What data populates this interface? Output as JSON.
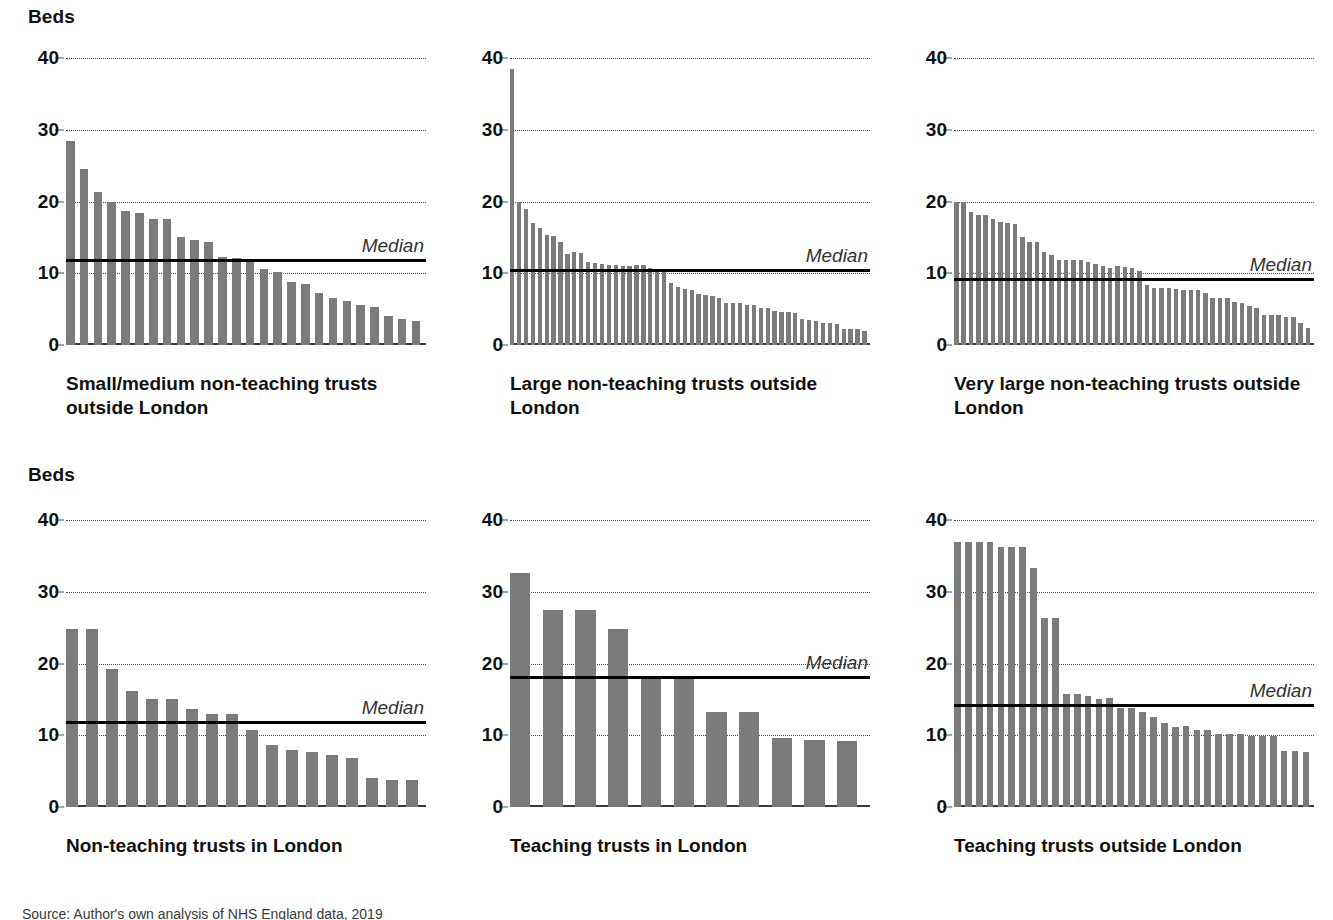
{
  "axis_title": "Beds",
  "median_label": "Median",
  "colors": {
    "bar": "#7b7b7b",
    "median_line": "#000000",
    "gridline": "#4d4d4d",
    "axis": "#3a3a3a",
    "text": "#111111"
  },
  "yticks": [
    "0",
    "10",
    "20",
    "30",
    "40"
  ],
  "footnote": "Source: Author's own analysis of NHS England data, 2019",
  "chart_data": [
    {
      "type": "bar",
      "title": "Small/medium non-teaching trusts outside London",
      "ylabel": "Beds",
      "xlabel": "",
      "ylim": [
        0,
        40
      ],
      "yticks": [
        0,
        10,
        20,
        30,
        40
      ],
      "grid": true,
      "median": 12.0,
      "median_annotation": "Median",
      "values": [
        28.4,
        24.5,
        21.3,
        20.0,
        18.7,
        18.4,
        17.6,
        17.5,
        15.1,
        14.6,
        14.3,
        12.3,
        12.1,
        12.0,
        10.6,
        10.2,
        8.8,
        8.5,
        7.3,
        6.6,
        6.1,
        5.6,
        5.3,
        4.0,
        3.6,
        3.3
      ]
    },
    {
      "type": "bar",
      "title": "Large non-teaching trusts outside London",
      "ylabel": "Beds",
      "xlabel": "",
      "ylim": [
        0,
        40
      ],
      "yticks": [
        0,
        10,
        20,
        30,
        40
      ],
      "grid": true,
      "median": 10.6,
      "median_annotation": "Median",
      "values": [
        38.5,
        20.0,
        19.0,
        17.0,
        16.3,
        15.3,
        15.2,
        14.4,
        12.7,
        12.9,
        12.8,
        11.6,
        11.4,
        11.3,
        11.2,
        11.2,
        11.0,
        11.0,
        11.1,
        11.2,
        10.7,
        10.4,
        10.2,
        8.7,
        8.1,
        7.8,
        7.6,
        7.1,
        7.0,
        6.9,
        6.6,
        5.9,
        5.9,
        5.9,
        5.6,
        5.6,
        5.2,
        5.1,
        4.8,
        4.6,
        4.6,
        4.5,
        3.6,
        3.5,
        3.3,
        3.0,
        3.0,
        2.9,
        2.3,
        2.2,
        2.2,
        1.9
      ]
    },
    {
      "type": "bar",
      "title": "Very large non-teaching trusts outside London",
      "ylabel": "Beds",
      "xlabel": "",
      "ylim": [
        0,
        40
      ],
      "yticks": [
        0,
        10,
        20,
        30,
        40
      ],
      "grid": true,
      "median": 9.3,
      "median_annotation": "Median",
      "values": [
        20.0,
        20.0,
        18.6,
        18.1,
        18.1,
        17.6,
        17.1,
        17.0,
        16.8,
        15.1,
        14.3,
        14.3,
        12.9,
        12.6,
        11.9,
        11.9,
        11.9,
        11.8,
        11.6,
        11.3,
        11.0,
        10.8,
        11.0,
        10.9,
        10.8,
        10.3,
        8.4,
        8.0,
        8.0,
        8.0,
        7.8,
        7.7,
        7.6,
        7.6,
        7.3,
        6.5,
        6.5,
        6.5,
        6.0,
        5.9,
        5.4,
        5.1,
        4.2,
        4.2,
        4.2,
        3.9,
        3.9,
        3.1,
        2.4
      ]
    },
    {
      "type": "bar",
      "title": "Non-teaching trusts in London",
      "ylabel": "Beds",
      "xlabel": "",
      "ylim": [
        0,
        40
      ],
      "yticks": [
        0,
        10,
        20,
        30,
        40
      ],
      "grid": true,
      "median": 12.0,
      "median_annotation": "Median",
      "values": [
        24.8,
        24.8,
        19.2,
        16.2,
        15.0,
        15.0,
        13.7,
        12.9,
        12.9,
        10.8,
        8.6,
        8.0,
        7.7,
        7.3,
        6.8,
        4.1,
        3.7,
        3.7
      ]
    },
    {
      "type": "bar",
      "title": "Teaching trusts in London",
      "ylabel": "Beds",
      "xlabel": "",
      "ylim": [
        0,
        40
      ],
      "yticks": [
        0,
        10,
        20,
        30,
        40
      ],
      "grid": true,
      "median": 18.2,
      "median_annotation": "Median",
      "values": [
        32.6,
        27.5,
        27.5,
        24.8,
        17.9,
        17.9,
        13.3,
        13.3,
        9.6,
        9.3,
        9.2
      ]
    },
    {
      "type": "bar",
      "title": "Teaching trusts outside London",
      "ylabel": "Beds",
      "xlabel": "",
      "ylim": [
        0,
        40
      ],
      "yticks": [
        0,
        10,
        20,
        30,
        40
      ],
      "grid": true,
      "median": 14.3,
      "median_annotation": "Median",
      "values": [
        36.9,
        36.9,
        36.9,
        36.9,
        36.2,
        36.2,
        36.2,
        33.3,
        26.4,
        26.4,
        15.7,
        15.7,
        15.5,
        15.1,
        15.2,
        13.8,
        13.8,
        13.3,
        12.5,
        11.7,
        11.2,
        11.3,
        10.8,
        10.8,
        10.2,
        10.2,
        10.2,
        9.9,
        9.9,
        9.9,
        7.8,
        7.8,
        7.7
      ]
    }
  ]
}
